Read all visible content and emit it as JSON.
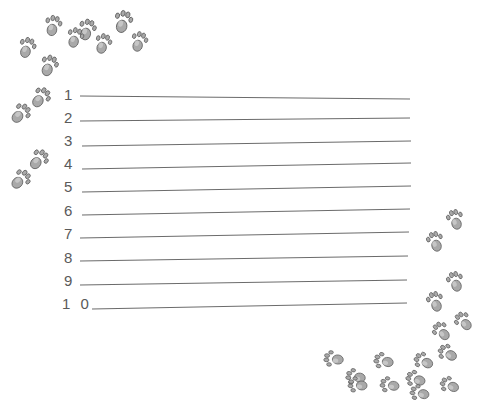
{
  "worksheet": {
    "title": "Numbered Writing Lines Worksheet",
    "background_color": "#ffffff",
    "line_color": "#6b6b6b",
    "number_color": "#5a5a5a",
    "paw_fill_color": "#a9a9a9",
    "paw_outline_color": "#595959",
    "paw_highlight_color": "#d0d0d0",
    "lines": [
      {
        "number": "1",
        "label_x": 64,
        "label_y": 87,
        "rule_x1": 80,
        "rule_y1": 96,
        "rule_x2": 410,
        "rule_y2": 99
      },
      {
        "number": "2",
        "label_x": 64,
        "label_y": 110,
        "rule_x1": 80,
        "rule_y1": 121,
        "rule_x2": 410,
        "rule_y2": 118
      },
      {
        "number": "3",
        "label_x": 64,
        "label_y": 133,
        "rule_x1": 82,
        "rule_y1": 146,
        "rule_x2": 411,
        "rule_y2": 141
      },
      {
        "number": "4",
        "label_x": 64,
        "label_y": 156,
        "rule_x1": 82,
        "rule_y1": 169,
        "rule_x2": 411,
        "rule_y2": 163
      },
      {
        "number": "5",
        "label_x": 64,
        "label_y": 179,
        "rule_x1": 82,
        "rule_y1": 192,
        "rule_x2": 411,
        "rule_y2": 186
      },
      {
        "number": "6",
        "label_x": 64,
        "label_y": 203,
        "rule_x1": 82,
        "rule_y1": 215,
        "rule_x2": 410,
        "rule_y2": 209
      },
      {
        "number": "7",
        "label_x": 64,
        "label_y": 226,
        "rule_x1": 80,
        "rule_y1": 238,
        "rule_x2": 409,
        "rule_y2": 232
      },
      {
        "number": "8",
        "label_x": 64,
        "label_y": 250,
        "rule_x1": 80,
        "rule_y1": 261,
        "rule_x2": 408,
        "rule_y2": 256
      },
      {
        "number": "9",
        "label_x": 64,
        "label_y": 273,
        "rule_x1": 80,
        "rule_y1": 285,
        "rule_x2": 407,
        "rule_y2": 280
      },
      {
        "number": "1 0",
        "label_x": 62,
        "label_y": 296,
        "rule_x1": 92,
        "rule_y1": 309,
        "rule_x2": 407,
        "rule_y2": 303
      }
    ],
    "paw_prints": [
      {
        "id": "paw-1",
        "x": 112,
        "y": 8,
        "rotate": 14,
        "scale": 1.0
      },
      {
        "id": "paw-2",
        "x": 76,
        "y": 16,
        "rotate": 16,
        "scale": 0.95
      },
      {
        "id": "paw-3",
        "x": 42,
        "y": 12,
        "rotate": 12,
        "scale": 0.92
      },
      {
        "id": "paw-4",
        "x": 16,
        "y": 34,
        "rotate": 18,
        "scale": 0.92
      },
      {
        "id": "paw-5",
        "x": 38,
        "y": 52,
        "rotate": 20,
        "scale": 0.95
      },
      {
        "id": "paw-6",
        "x": 64,
        "y": 24,
        "rotate": 16,
        "scale": 0.9
      },
      {
        "id": "paw-7",
        "x": 92,
        "y": 30,
        "rotate": 16,
        "scale": 0.9
      },
      {
        "id": "paw-8",
        "x": 128,
        "y": 28,
        "rotate": 16,
        "scale": 0.9
      },
      {
        "id": "paw-9",
        "x": 30,
        "y": 84,
        "rotate": 36,
        "scale": 0.95
      },
      {
        "id": "paw-10",
        "x": 10,
        "y": 100,
        "rotate": 42,
        "scale": 0.95
      },
      {
        "id": "paw-11",
        "x": 28,
        "y": 146,
        "rotate": 38,
        "scale": 0.95
      },
      {
        "id": "paw-12",
        "x": 10,
        "y": 166,
        "rotate": 44,
        "scale": 0.95
      },
      {
        "id": "paw-13",
        "x": 444,
        "y": 206,
        "rotate": -18,
        "scale": 0.9
      },
      {
        "id": "paw-14",
        "x": 424,
        "y": 228,
        "rotate": -18,
        "scale": 0.9
      },
      {
        "id": "paw-15",
        "x": 444,
        "y": 268,
        "rotate": -18,
        "scale": 0.9
      },
      {
        "id": "paw-16",
        "x": 424,
        "y": 288,
        "rotate": -18,
        "scale": 0.9
      },
      {
        "id": "paw-17",
        "x": 430,
        "y": 318,
        "rotate": -42,
        "scale": 0.88
      },
      {
        "id": "paw-18",
        "x": 452,
        "y": 308,
        "rotate": -42,
        "scale": 0.88
      },
      {
        "id": "paw-19",
        "x": 436,
        "y": 340,
        "rotate": -60,
        "scale": 0.88
      },
      {
        "id": "paw-20",
        "x": 412,
        "y": 348,
        "rotate": -64,
        "scale": 0.88
      },
      {
        "id": "paw-21",
        "x": 404,
        "y": 366,
        "rotate": -72,
        "scale": 0.88
      },
      {
        "id": "paw-22",
        "x": 372,
        "y": 348,
        "rotate": -78,
        "scale": 0.88
      },
      {
        "id": "paw-23",
        "x": 344,
        "y": 364,
        "rotate": -82,
        "scale": 0.88
      },
      {
        "id": "paw-24",
        "x": 322,
        "y": 346,
        "rotate": -84,
        "scale": 0.88
      },
      {
        "id": "paw-25",
        "x": 346,
        "y": 372,
        "rotate": -84,
        "scale": 0.86
      },
      {
        "id": "paw-26",
        "x": 378,
        "y": 372,
        "rotate": -80,
        "scale": 0.86
      },
      {
        "id": "paw-27",
        "x": 408,
        "y": 380,
        "rotate": -76,
        "scale": 0.86
      },
      {
        "id": "paw-28",
        "x": 438,
        "y": 372,
        "rotate": -66,
        "scale": 0.86
      }
    ]
  }
}
